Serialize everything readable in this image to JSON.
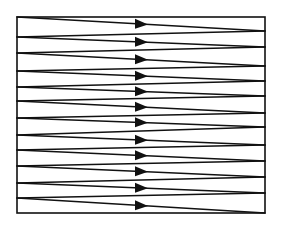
{
  "diagram": {
    "colors": {
      "stroke": "#111111",
      "background": "#ffffff"
    },
    "frame": {
      "left": 17,
      "top": 17,
      "right": 265,
      "bottom": 213
    },
    "arrow": {
      "base_x": 135,
      "tip_x": 148,
      "half_height": 5,
      "direction": "right"
    },
    "forward_sweeps": [
      {
        "left_y": 17,
        "right_y": 31
      },
      {
        "left_y": 37,
        "right_y": 47
      },
      {
        "left_y": 53,
        "right_y": 66
      },
      {
        "left_y": 71,
        "right_y": 81
      },
      {
        "left_y": 87,
        "right_y": 96
      },
      {
        "left_y": 101,
        "right_y": 113
      },
      {
        "left_y": 118,
        "right_y": 127
      },
      {
        "left_y": 135,
        "right_y": 145
      },
      {
        "left_y": 150,
        "right_y": 161
      },
      {
        "left_y": 166,
        "right_y": 177
      },
      {
        "left_y": 183,
        "right_y": 193
      },
      {
        "left_y": 198,
        "right_y": 213
      }
    ],
    "sweep_count": 12
  }
}
